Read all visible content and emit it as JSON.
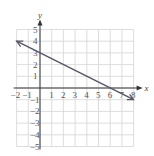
{
  "chart_data": {
    "type": "line",
    "title": "",
    "xlabel": "x",
    "ylabel": "y",
    "xlim": [
      -2,
      8
    ],
    "ylim": [
      -5,
      5
    ],
    "grid": true,
    "x_ticks": [
      "-2",
      "-1",
      "1",
      "2",
      "3",
      "4",
      "5",
      "6",
      "7",
      "8"
    ],
    "y_ticks": [
      "5",
      "4",
      "3",
      "2",
      "1",
      "-1",
      "-2",
      "-3",
      "-4",
      "-5"
    ],
    "series": [
      {
        "name": "line",
        "x": [
          -2,
          0,
          6,
          8
        ],
        "y": [
          4,
          3,
          0,
          -1
        ],
        "arrows": "both"
      }
    ]
  },
  "colors": {
    "grid": "#d4d4d4",
    "axis": "#333333",
    "line": "#555566"
  }
}
